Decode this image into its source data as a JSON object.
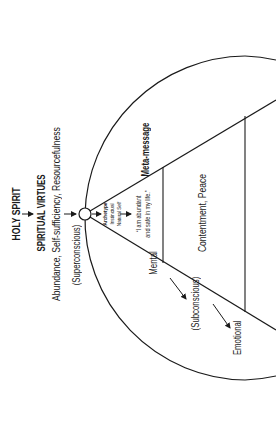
{
  "diagram": {
    "title": "HOLY SPIRIT",
    "level_heading": "SPIRITUAL VIRTUES",
    "virtues": "Abundance, Self-sufficiency, Resourcefulness",
    "superconscious_label": "(Superconscious)",
    "apex_label": {
      "line1": "Archetype",
      "line2": "Instinctual",
      "line3": "Natural Self"
    },
    "affirmation": {
      "line1": "“I am abundant",
      "line2": "and safe in my life.”"
    },
    "meta_message_label": "Meta-message",
    "state_label": "Contentment, Peace",
    "mental_label": "Mental",
    "subconscious_label": "(Subconscious)",
    "emotional_label": "Emotional",
    "colors": {
      "ink": "#1a1a1a",
      "background": "#ffffff"
    },
    "orientation": "rotated -90deg"
  }
}
